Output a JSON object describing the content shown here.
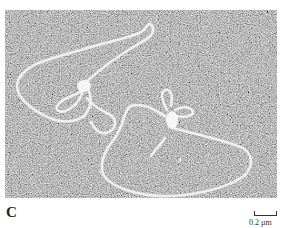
{
  "figure": {
    "panel_label": "C",
    "scale_bar_label": "0.2 µm",
    "image_description": "Electron micrograph of two looped DNA molecules with protein complexes at junctions on a grainy grey background",
    "colors": {
      "background": "#ffffff",
      "micrograph_mid": "#6a6a6a",
      "strand": "#eeeeee",
      "text": "#222222"
    }
  }
}
